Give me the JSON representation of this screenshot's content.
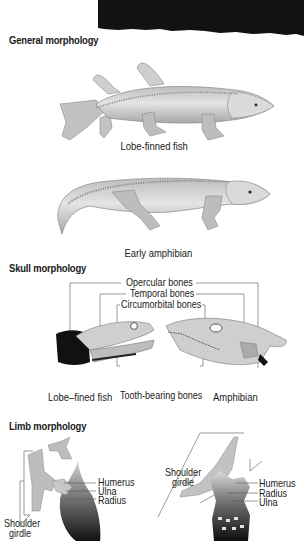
{
  "colors": {
    "background": "#ffffff",
    "top_band": "#121212",
    "body_fill": "#c9c9c9",
    "body_shade": "#a9a9a9",
    "bone_line": "#8a8a8a",
    "dark_fill": "#111111",
    "text": "#1a1a1a"
  },
  "sections": {
    "general": {
      "heading": "General morphology",
      "figures": [
        {
          "id": "lobe_finned_fish",
          "caption": "Lobe-finned fish"
        },
        {
          "id": "early_amphibian",
          "caption": "Early amphibian"
        }
      ]
    },
    "skull": {
      "heading": "Skull morphology",
      "labels": {
        "opercular": "Opercular bones",
        "temporal": "Temporal bones",
        "circumorbital": "Circumorbital bones",
        "tooth_bearing": "Tooth-bearing bones"
      },
      "captions": {
        "fish": "Lobe–fined fish",
        "amphibian": "Amphibian"
      }
    },
    "limb": {
      "heading": "Limb morphology",
      "fish_labels": {
        "humerus": "Humerus",
        "ulna": "Ulna",
        "radius": "Radius",
        "shoulder_girdle_line1": "Shoulder",
        "shoulder_girdle_line2": "girdle"
      },
      "amphibian_labels": {
        "shoulder_girdle_line1": "Shoulder",
        "shoulder_girdle_line2": "girdle",
        "humerus": "Humerus",
        "radius": "Radius",
        "ulna": "Ulna"
      }
    }
  }
}
